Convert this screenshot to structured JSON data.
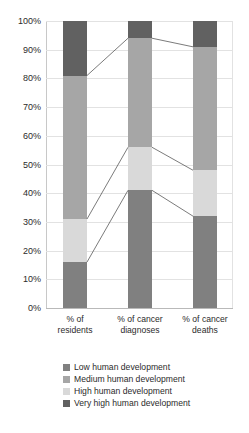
{
  "chart_data": {
    "type": "bar",
    "subtype": "100% stacked bar with connector bands",
    "title": "",
    "xlabel": "",
    "ylabel": "",
    "ylim": [
      0,
      100
    ],
    "ytick_labels": [
      "100%",
      "90%",
      "80%",
      "70%",
      "60%",
      "50%",
      "40%",
      "30%",
      "20%",
      "10%",
      "0%"
    ],
    "ytick_values": [
      100,
      90,
      80,
      70,
      60,
      50,
      40,
      30,
      20,
      10,
      0
    ],
    "grid": true,
    "legend_position": "bottom",
    "categories": [
      "% of residents",
      "% of cancer diagnoses",
      "% of cancer deaths"
    ],
    "category_lines": [
      [
        "% of",
        "residents"
      ],
      [
        "% of cancer",
        "diagnoses"
      ],
      [
        "% of cancer",
        "deaths"
      ]
    ],
    "series": [
      {
        "name": "Low human development",
        "color": "#808080",
        "values": [
          16,
          41,
          32
        ]
      },
      {
        "name": "High human development",
        "color": "#d9d9d9",
        "values": [
          15,
          15,
          16
        ]
      },
      {
        "name": "Medium human development",
        "color": "#a6a6a6",
        "values": [
          50,
          38,
          43
        ]
      },
      {
        "name": "Very high human development",
        "color": "#616161",
        "values": [
          19,
          6,
          9
        ]
      }
    ],
    "stack_order_bottom_to_top": [
      "Low human development",
      "High human development",
      "Medium human development",
      "Very high human development"
    ],
    "cumulative_boundaries": {
      "% of residents": [
        0,
        16,
        31,
        81,
        100
      ],
      "% of cancer diagnoses": [
        0,
        41,
        56,
        94,
        100
      ],
      "% of cancer deaths": [
        0,
        32,
        48,
        91,
        100
      ]
    },
    "connector_color": "#595959"
  },
  "legend": {
    "items": [
      {
        "label": "Low human development",
        "color": "#808080"
      },
      {
        "label": "Medium human development",
        "color": "#a6a6a6"
      },
      {
        "label": "High human development",
        "color": "#d9d9d9"
      },
      {
        "label": "Very high human development",
        "color": "#616161"
      }
    ]
  }
}
